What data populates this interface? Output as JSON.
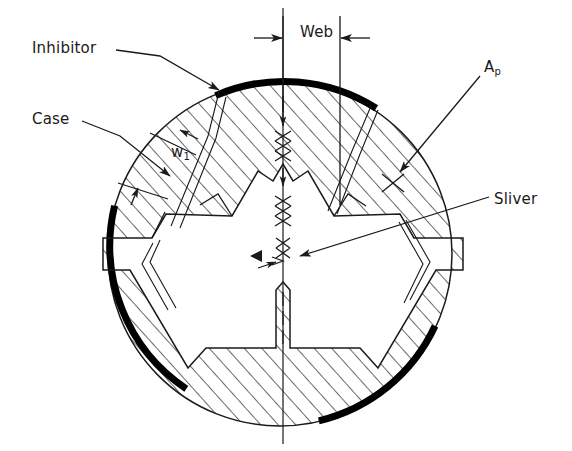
{
  "figure": {
    "domain": "engineering-diagram",
    "width": 572,
    "height": 451,
    "background_color": "#ffffff",
    "line_color": "#1a1a1a",
    "inhibitor_color": "#000000",
    "hatch_color": "#1a1a1a"
  },
  "labels": {
    "inhibitor": "Inhibitor",
    "case": "Case",
    "web": "Web",
    "ap_base": "A",
    "ap_sub": "p",
    "sliver": "Sliver",
    "w1_base": "w",
    "w1_sub": "1"
  },
  "geometry": {
    "circle": {
      "cx": 280,
      "cy": 254,
      "r": 172
    },
    "inner_circle": {
      "cx": 280,
      "cy": 254,
      "r": 162
    },
    "centerline_x": 283,
    "centerline_top": 8,
    "centerline_bottom": 444,
    "web_dim": {
      "left_x": 283,
      "right_x": 340,
      "y": 38,
      "top_y": 16,
      "bottom_y": 110
    },
    "star_points": 3,
    "star_rotation_deg": 180,
    "inhibitor_arcs_deg": [
      {
        "start": -108,
        "end": -60
      },
      {
        "start": 12,
        "end": 60
      },
      {
        "start": 132,
        "end": 180
      }
    ]
  },
  "callouts": [
    {
      "name": "inhibitor",
      "from": [
        122,
        50
      ],
      "to": [
        222,
        91
      ]
    },
    {
      "name": "case",
      "from": [
        95,
        121
      ],
      "to": [
        168,
        174
      ]
    },
    {
      "name": "ap",
      "from": [
        478,
        78
      ],
      "to": [
        395,
        178
      ]
    },
    {
      "name": "sliver",
      "from": [
        490,
        198
      ],
      "to": [
        295,
        258
      ]
    }
  ]
}
